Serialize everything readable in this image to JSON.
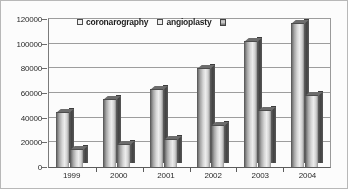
{
  "chart_data": {
    "type": "bar",
    "title": "",
    "subtitle": "",
    "xlabel": "",
    "ylabel": "",
    "categories": [
      "1999",
      "2000",
      "2001",
      "2002",
      "2003",
      "2004"
    ],
    "series": [
      {
        "name": "coronarography",
        "values": [
          45000,
          55000,
          63000,
          80000,
          102000,
          117000
        ]
      },
      {
        "name": "angioplasty",
        "values": [
          15000,
          19000,
          23000,
          34000,
          46000,
          58000
        ]
      }
    ],
    "legend": [
      {
        "label": "coronarography",
        "swatch": "series-a"
      },
      {
        "label": "angioplasty",
        "swatch": "series-b"
      },
      {
        "label": "",
        "swatch": "series-c"
      }
    ],
    "legend_position": "top-center",
    "ylim": [
      0,
      120000
    ],
    "ytick_values": [
      0,
      20000,
      40000,
      60000,
      80000,
      100000,
      120000
    ],
    "ytick_labels": [
      "0",
      "20000",
      "40000",
      "60000",
      "80000",
      "100000",
      "120000"
    ],
    "grid": true,
    "grid_axis": "y",
    "style": "3d-columns-grayscale",
    "colors": {
      "bar_face_light": "#efefef",
      "bar_face_dark": "#4a4a4a",
      "bar_side": "#3f3f3f",
      "gridline": "#9d9d9d",
      "axis": "#5a5a5a",
      "text": "#262626",
      "background": "#ffffff",
      "border": "#b8b8b8"
    }
  }
}
